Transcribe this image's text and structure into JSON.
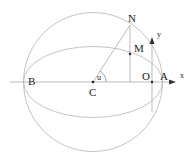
{
  "diagram": {
    "labels": {
      "N": "N",
      "M": "M",
      "B": "B",
      "C": "C",
      "O": "O",
      "A": "A",
      "u": "u",
      "x": "x",
      "y": "y"
    },
    "colors": {
      "curve": "#b8b8b8",
      "line": "#999999",
      "point": "#222222",
      "text": "#222222"
    }
  }
}
